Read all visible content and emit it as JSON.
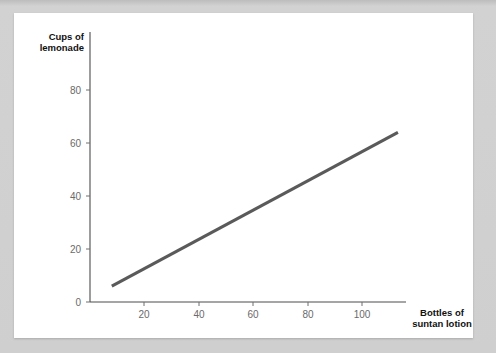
{
  "page": {
    "background_color": "#cccccc",
    "card_color": "#ffffff"
  },
  "chart_data": {
    "type": "line",
    "title": "",
    "subtitle": "",
    "xlabel": "Bottles of suntan lotion",
    "ylabel": "Cups of lemonade",
    "ylabel_line1": "Cups of",
    "ylabel_line2": "lemonade",
    "xlabel_line1": "Bottles of",
    "xlabel_line2": "suntan lotion",
    "xlim": [
      0,
      116
    ],
    "ylim": [
      0,
      92
    ],
    "xticks": [
      20,
      40,
      60,
      80,
      100
    ],
    "yticks": [
      0,
      20,
      40,
      60,
      80
    ],
    "xtick_labels": [
      "20",
      "40",
      "60",
      "80",
      "100"
    ],
    "ytick_labels": [
      "0",
      "20",
      "40",
      "60",
      "80"
    ],
    "grid": false,
    "legend": false,
    "legend_position": "none",
    "line_color": "#5a5a5a",
    "axis_color": "#4c4c4c",
    "tick_label_color": "#6a6a6a",
    "series": [
      {
        "name": "lemonade vs suntan lotion",
        "x": [
          8,
          113
        ],
        "y": [
          6,
          64
        ],
        "color": "#5a5a5a",
        "width": 3.1
      }
    ]
  }
}
